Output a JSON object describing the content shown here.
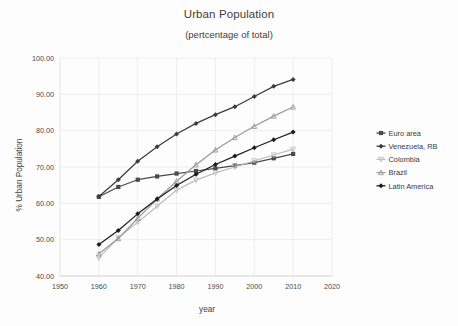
{
  "chart_data": {
    "type": "line",
    "title": "Urban Population",
    "subtitle": "(pertcentage of  total)",
    "xlabel": "year",
    "ylabel": "% Urban Population",
    "xlim": [
      1950,
      2020
    ],
    "ylim": [
      40,
      100
    ],
    "xticks": [
      "1950",
      "1960",
      "1970",
      "1980",
      "1990",
      "2000",
      "2010",
      "2020"
    ],
    "yticks": [
      "40.00",
      "50.00",
      "60.00",
      "70.00",
      "80.00",
      "90.00",
      "100.00"
    ],
    "grid": true,
    "legend_position": "right",
    "x": [
      1960,
      1965,
      1970,
      1975,
      1980,
      1985,
      1990,
      1995,
      2000,
      2005,
      2010
    ],
    "series": [
      {
        "name": "Euro area",
        "color": "#4a4a4a",
        "marker": "square",
        "values": [
          61.8,
          64.5,
          66.5,
          67.4,
          68.2,
          68.9,
          69.6,
          70.4,
          71.2,
          72.4,
          73.6
        ]
      },
      {
        "name": "Venezuela, RB",
        "color": "#3d3d3d",
        "marker": "diamond",
        "values": [
          61.9,
          66.5,
          71.6,
          75.6,
          79.1,
          82.0,
          84.4,
          86.6,
          89.4,
          92.2,
          94.1
        ]
      },
      {
        "name": "Colombia",
        "color": "#bdbdbd",
        "marker": "v",
        "values": [
          45.0,
          50.5,
          54.8,
          59.2,
          63.6,
          66.4,
          68.4,
          70.0,
          71.7,
          73.3,
          74.9
        ]
      },
      {
        "name": "Brazil",
        "color": "#9a9a9a",
        "marker": "triangle",
        "values": [
          46.1,
          50.3,
          55.9,
          61.2,
          66.1,
          70.6,
          74.7,
          78.1,
          81.2,
          84.0,
          86.5
        ]
      },
      {
        "name": "Latin America",
        "color": "#1d1d1d",
        "marker": "diamond",
        "values": [
          48.7,
          52.5,
          57.1,
          61.2,
          64.9,
          68.0,
          70.7,
          73.0,
          75.3,
          77.5,
          79.6
        ]
      }
    ]
  },
  "legend": {
    "items": [
      {
        "label": "Euro area"
      },
      {
        "label": "Venezuela, RB"
      },
      {
        "label": "Colombia"
      },
      {
        "label": "Brazil"
      },
      {
        "label": "Latin America"
      }
    ]
  }
}
